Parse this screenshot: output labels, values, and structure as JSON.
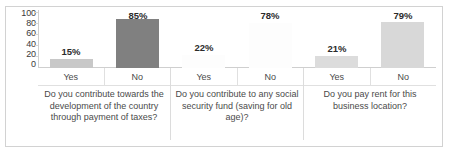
{
  "chart_data": {
    "type": "bar",
    "title": "",
    "xlabel": "",
    "ylabel": "",
    "ylim": [
      0,
      100
    ],
    "yticks": [
      "100",
      "80",
      "60",
      "40",
      "20",
      "0"
    ],
    "grid": false,
    "legend": "none",
    "categories": [
      "Yes",
      "No",
      "Yes",
      "No",
      "Yes",
      "No"
    ],
    "values": [
      15,
      85,
      22,
      78,
      21,
      79
    ],
    "data_labels": [
      "15%",
      "85%",
      "22%",
      "78%",
      "21%",
      "79%"
    ],
    "groups": [
      {
        "question": "Do you contribute towards the development of the country through payment of taxes?",
        "bars": [
          {
            "category": "Yes",
            "value": 15,
            "label": "15%",
            "color": "#c8c8c8"
          },
          {
            "category": "No",
            "value": 85,
            "label": "85%",
            "color": "#808080"
          }
        ]
      },
      {
        "question": "Do you contribute to any social security fund (saving for old age)?",
        "bars": [
          {
            "category": "Yes",
            "value": 22,
            "label": "22%",
            "color": "#fdfdfd"
          },
          {
            "category": "No",
            "value": 78,
            "label": "78%",
            "color": "#fdfdfd"
          }
        ]
      },
      {
        "question": "Do you pay rent for this business location?",
        "bars": [
          {
            "category": "Yes",
            "value": 21,
            "label": "21%",
            "color": "#dcdcdc"
          },
          {
            "category": "No",
            "value": 79,
            "label": "79%",
            "color": "#d8d8d8"
          }
        ]
      }
    ]
  },
  "axis": {
    "ticks": [
      "100",
      "80",
      "60",
      "40",
      "20",
      "0"
    ]
  },
  "cut_title": "",
  "colors": {
    "frame": "#d2d2d2",
    "gridline": "#e0e0e0",
    "text": "#4a4a4a",
    "label_text": "#2b2b2b"
  }
}
